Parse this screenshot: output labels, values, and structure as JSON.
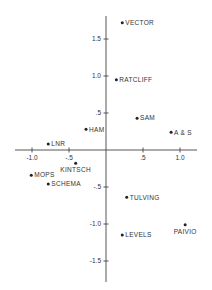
{
  "chart_data": {
    "type": "scatter",
    "title": "",
    "xlabel": "",
    "ylabel": "",
    "xlim": [
      -1.25,
      1.25
    ],
    "ylim": [
      -1.8,
      1.8
    ],
    "grid": false,
    "legend": null,
    "x_ticks": [
      -1.0,
      -0.5,
      0.5,
      1.0
    ],
    "x_tick_labels": [
      "-1.0",
      "-.5",
      ".5",
      "1.0"
    ],
    "y_ticks": [
      1.5,
      1.0,
      0.5,
      -0.5,
      -1.0,
      -1.5
    ],
    "y_tick_labels": [
      "1.5",
      "1.0",
      ".5",
      "-.5",
      "-1.0",
      "-1.5"
    ],
    "points": [
      {
        "label": "VECTOR",
        "x": 0.22,
        "y": 1.72,
        "pos": "right"
      },
      {
        "label": "RATCLIFF",
        "x": 0.14,
        "y": 0.95,
        "pos": "right"
      },
      {
        "label": "SAM",
        "x": 0.42,
        "y": 0.43,
        "pos": "right"
      },
      {
        "label": "A & S",
        "x": 0.88,
        "y": 0.24,
        "pos": "right"
      },
      {
        "label": "HAM",
        "x": -0.27,
        "y": 0.28,
        "pos": "right"
      },
      {
        "label": "LNR",
        "x": -0.78,
        "y": 0.08,
        "pos": "right"
      },
      {
        "label": "KINTSCH",
        "x": -0.41,
        "y": -0.18,
        "pos": "below"
      },
      {
        "label": "MOPS",
        "x": -1.01,
        "y": -0.34,
        "pos": "right"
      },
      {
        "label": "SCHEMA",
        "x": -0.78,
        "y": -0.46,
        "pos": "right"
      },
      {
        "label": "TULVING",
        "x": 0.28,
        "y": -0.64,
        "pos": "right"
      },
      {
        "label": "LEVELS",
        "x": 0.22,
        "y": -1.15,
        "pos": "right"
      },
      {
        "label": "PAIVIO",
        "x": 1.07,
        "y": -1.01,
        "pos": "below"
      }
    ]
  }
}
